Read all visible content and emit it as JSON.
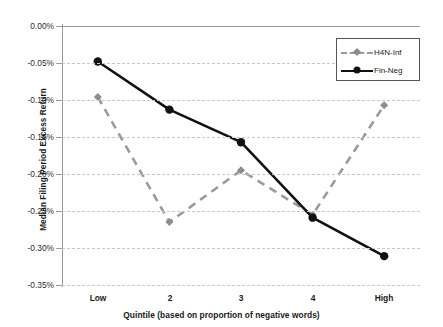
{
  "figure": {
    "top_caption_fragment": "",
    "background": "#ffffff"
  },
  "axes": {
    "y_title": "Median Filing Period Excess Return",
    "x_title": "Quintile (based on proportion of negative words)",
    "y_ticks": [
      "0.00%",
      "-0.05%",
      "-0.10%",
      "-0.15%",
      "-0.20%",
      "-0.25%",
      "-0.30%",
      "-0.35%"
    ],
    "x_ticks": [
      "Low",
      "2",
      "3",
      "4",
      "High"
    ]
  },
  "legend": {
    "position": "top-right-inside",
    "entries": [
      {
        "label": "H4N-Inf",
        "color": "#999999",
        "style": "dashed",
        "marker": "diamond"
      },
      {
        "label": "Fin-Neg",
        "color": "#111111",
        "style": "solid",
        "marker": "circle"
      }
    ]
  },
  "chart_data": {
    "type": "line",
    "title": "",
    "xlabel": "Quintile (based on proportion of negative words)",
    "ylabel": "Median Filing Period Excess Return",
    "categories": [
      "Low",
      "2",
      "3",
      "4",
      "High"
    ],
    "ylim": [
      -0.35,
      0.0
    ],
    "ytick_values": [
      0.0,
      -0.05,
      -0.1,
      -0.15,
      -0.2,
      -0.25,
      -0.3,
      -0.35
    ],
    "yunit": "%",
    "grid": true,
    "legend_position": "upper right",
    "series": [
      {
        "name": "H4N-Inf",
        "color": "#999999",
        "linestyle": "dashed",
        "marker": "diamond",
        "values": [
          -0.096,
          -0.265,
          -0.195,
          -0.255,
          -0.107
        ]
      },
      {
        "name": "Fin-Neg",
        "color": "#111111",
        "linestyle": "solid",
        "marker": "circle",
        "values": [
          -0.048,
          -0.113,
          -0.157,
          -0.259,
          -0.311
        ]
      }
    ]
  }
}
